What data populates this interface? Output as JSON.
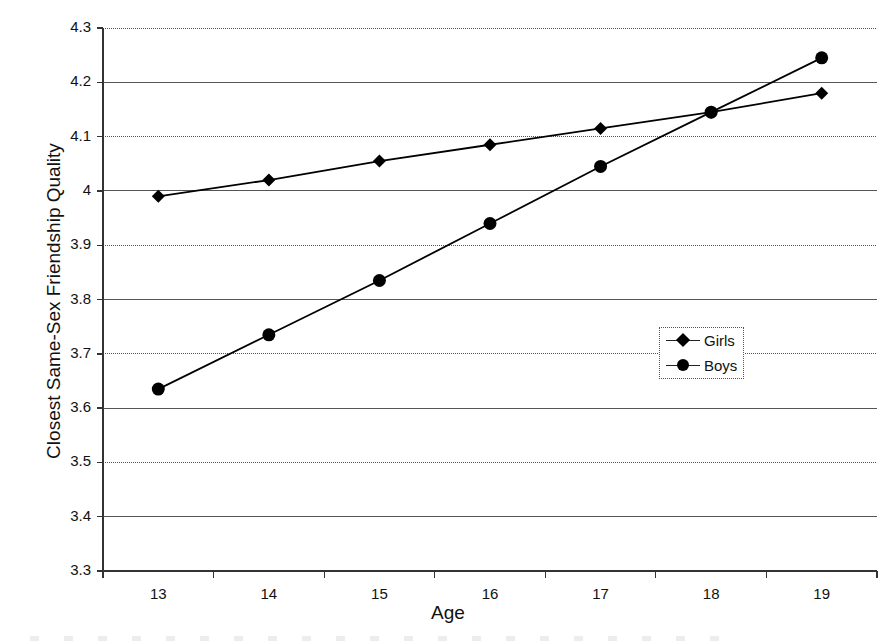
{
  "chart_data": {
    "type": "line",
    "title": "",
    "subtitle": "",
    "xlabel": "Age",
    "ylabel": "Closest Same-Sex Friendship Quality",
    "categories": [
      13,
      14,
      15,
      16,
      17,
      18,
      19
    ],
    "x_tick_labels": [
      "13",
      "14",
      "15",
      "16",
      "17",
      "18",
      "19"
    ],
    "y_tick_labels": [
      "4.3",
      "4.2",
      "4.1",
      "4",
      "3.9",
      "3.8",
      "3.7",
      "3.6",
      "3.5",
      "3.4",
      "3.3"
    ],
    "y_tick_values": [
      4.3,
      4.2,
      4.1,
      4.0,
      3.9,
      3.8,
      3.7,
      3.6,
      3.5,
      3.4,
      3.3
    ],
    "ylim": [
      3.3,
      4.3
    ],
    "grid": true,
    "grid_axis": "y",
    "legend_position": "center-right",
    "series": [
      {
        "name": "Girls",
        "marker": "diamond",
        "color": "#000000",
        "values": [
          3.99,
          4.02,
          4.055,
          4.085,
          4.115,
          4.145,
          4.18
        ]
      },
      {
        "name": "Boys",
        "marker": "circle",
        "color": "#000000",
        "values": [
          3.635,
          3.735,
          3.835,
          3.94,
          4.045,
          4.145,
          4.245
        ]
      }
    ]
  },
  "legend": {
    "entries": [
      {
        "label": "Girls",
        "marker": "diamond"
      },
      {
        "label": "Boys",
        "marker": "circle"
      }
    ]
  },
  "axes": {
    "x_title": "Age",
    "y_title": "Closest Same-Sex Friendship Quality"
  }
}
